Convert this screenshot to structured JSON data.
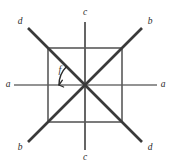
{
  "figure": {
    "canvas": {
      "width": 170,
      "height": 166,
      "background": "#ffffff"
    },
    "center": {
      "x": 85,
      "y": 85
    }
  },
  "colors": {
    "diagonal_line": "#3a3a3a",
    "orthogonal_line": "#6f6f6f",
    "vertical_line": "#4a4a4a",
    "square_stroke": "#5a5a5a",
    "label_text": "#2b2b2b",
    "arc_stroke": "#2b2b2b"
  },
  "square": {
    "name": "inner-square",
    "x1": 48,
    "y1": 48,
    "x2": 122,
    "y2": 122,
    "stroke_width": 1.6
  },
  "axes": [
    {
      "id": "axis-a",
      "orientation": "horizontal",
      "stroke_width": 1.7,
      "x1": 14,
      "y1": 85,
      "x2": 157,
      "y2": 85,
      "label_start": "a",
      "label_end": "a",
      "label_start_pos": {
        "x": 8,
        "y": 85
      },
      "label_end_pos": {
        "x": 163,
        "y": 85
      }
    },
    {
      "id": "axis-c",
      "orientation": "vertical",
      "stroke_width": 1.7,
      "x1": 85,
      "y1": 22,
      "x2": 85,
      "y2": 150,
      "label_start": "c",
      "label_end": "c",
      "label_start_pos": {
        "x": 85,
        "y": 13
      },
      "label_end_pos": {
        "x": 85,
        "y": 158
      }
    },
    {
      "id": "axis-d",
      "orientation": "diagonal-nw-se",
      "stroke_width": 2.6,
      "x1": 28,
      "y1": 28,
      "x2": 142,
      "y2": 142,
      "label_start": "d",
      "label_end": "d",
      "label_start_pos": {
        "x": 20,
        "y": 22
      },
      "label_end_pos": {
        "x": 150,
        "y": 148
      }
    },
    {
      "id": "axis-b",
      "orientation": "diagonal-sw-ne",
      "stroke_width": 2.6,
      "x1": 28,
      "y1": 142,
      "x2": 142,
      "y2": 28,
      "label_start": "b",
      "label_end": "b",
      "label_start_pos": {
        "x": 20,
        "y": 148
      },
      "label_end_pos": {
        "x": 150,
        "y": 22
      }
    }
  ],
  "angle_marker": {
    "id": "angle-f",
    "label": "f",
    "label_pos": {
      "x": 60,
      "y": 71
    },
    "arc_radius": 26,
    "arc_start_deg": 180,
    "arc_end_deg": 135,
    "stroke_width": 1.4,
    "arrow": "pointing-to-horizontal-ray"
  }
}
